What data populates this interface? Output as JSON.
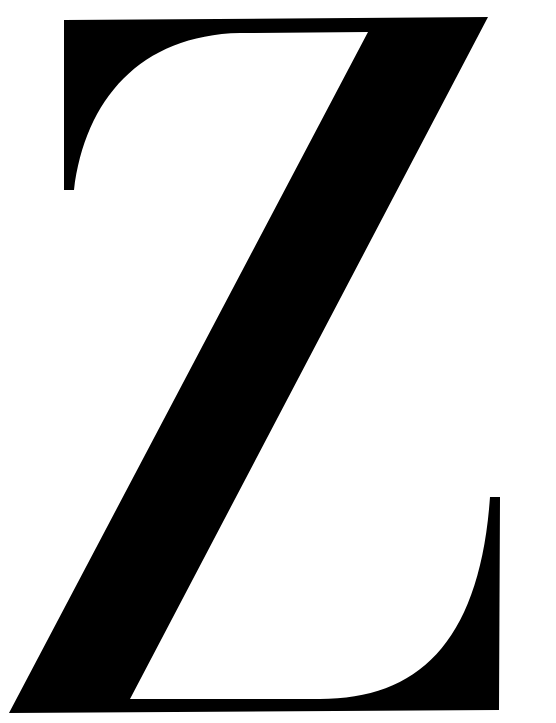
{
  "glyph": {
    "character": "Z",
    "description": "Large black serif capital letter Z",
    "fill_color": "#000000",
    "background_color": "#ffffff"
  }
}
